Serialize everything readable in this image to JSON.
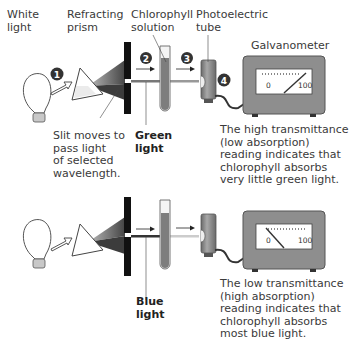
{
  "labels": {
    "white_light": [
      "White",
      "light"
    ],
    "refracting_prism": [
      "Refracting",
      "prism"
    ],
    "chlorophyll_solution": [
      "Chlorophyll",
      "solution"
    ],
    "photoelectric_tube": [
      "Photoelectric",
      "tube"
    ],
    "galvanometer": "Galvanometer",
    "slit": [
      "Slit moves to",
      "pass light",
      "of selected",
      "wavelength."
    ],
    "green_light": [
      "Green",
      "light"
    ],
    "blue_light": [
      "Blue",
      "light"
    ],
    "high_reading": [
      "The high transmittance",
      "(low absorption)",
      "reading indicates that",
      "chlorophyll absorbs",
      "very little green light."
    ],
    "low_reading": [
      "The low transmittance",
      "(high absorption)",
      "reading indicates that",
      "chlorophyll absorbs",
      "most blue light."
    ]
  },
  "steps": [
    "1",
    "2",
    "3",
    "4"
  ],
  "meter": {
    "min_label": "0",
    "max_label": "100"
  },
  "colors": {
    "device": "#8c8c8c",
    "device_dark": "#5f5f5f",
    "slit": "#111111",
    "marker": "#333333"
  }
}
